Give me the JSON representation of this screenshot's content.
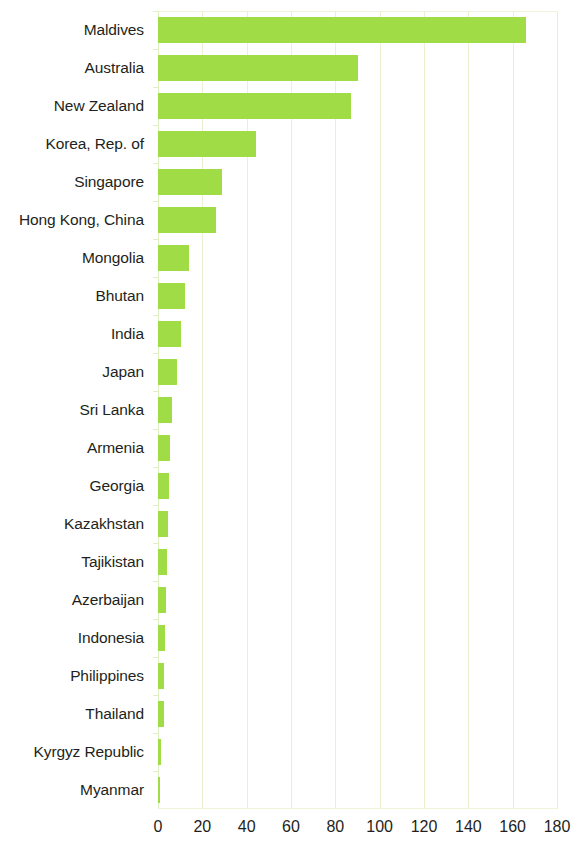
{
  "chart_data": {
    "type": "bar",
    "orientation": "horizontal",
    "title": "",
    "subtitle": "",
    "xlabel": "",
    "ylabel": "",
    "xlim": [
      0,
      180
    ],
    "ylim": null,
    "grid": true,
    "legend": null,
    "legend_position": "none",
    "series_color": "#9fdc45",
    "xticks": [
      0,
      20,
      40,
      60,
      80,
      100,
      120,
      140,
      160,
      180
    ],
    "xtick_labels": [
      "0",
      "20",
      "40",
      "60",
      "80",
      "100",
      "120",
      "140",
      "160",
      "180"
    ],
    "categories": [
      "Maldives",
      "Australia",
      "New Zealand",
      "Korea, Rep. of",
      "Singapore",
      "Hong Kong, China",
      "Mongolia",
      "Bhutan",
      "India",
      "Japan",
      "Sri Lanka",
      "Armenia",
      "Georgia",
      "Kazakhstan",
      "Tajikistan",
      "Azerbaijan",
      "Indonesia",
      "Philippines",
      "Thailand",
      "Kyrgyz Republic",
      "Myanmar"
    ],
    "values": [
      166,
      90,
      87,
      44,
      29,
      26,
      14,
      12,
      10.5,
      8.5,
      6.5,
      5.5,
      5,
      4.5,
      4,
      3.5,
      3,
      2.5,
      2.5,
      1.5,
      1
    ]
  }
}
